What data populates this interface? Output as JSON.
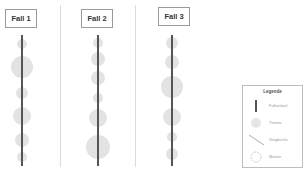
{
  "cases": [
    {
      "label": "Fall 1",
      "x": 22,
      "line_top": 35,
      "line_bottom": 166,
      "themes": [
        {
          "cy": 44,
          "r": 5
        },
        {
          "cy": 67,
          "r": 11
        },
        {
          "cy": 93,
          "r": 6
        },
        {
          "cy": 116,
          "r": 9
        },
        {
          "cy": 140,
          "r": 7
        },
        {
          "cy": 157,
          "r": 5
        }
      ]
    },
    {
      "label": "Fall 2",
      "x": 98,
      "line_top": 35,
      "line_bottom": 166,
      "themes": [
        {
          "cy": 43,
          "r": 5
        },
        {
          "cy": 59,
          "r": 7
        },
        {
          "cy": 78,
          "r": 7
        },
        {
          "cy": 98,
          "r": 5
        },
        {
          "cy": 118,
          "r": 9
        },
        {
          "cy": 147,
          "r": 12
        }
      ]
    },
    {
      "label": "Fall 3",
      "x": 172,
      "line_top": 35,
      "line_bottom": 166,
      "themes": [
        {
          "cy": 43,
          "r": 6
        },
        {
          "cy": 62,
          "r": 7
        },
        {
          "cy": 87,
          "r": 11
        },
        {
          "cy": 117,
          "r": 9
        },
        {
          "cy": 137,
          "r": 5
        },
        {
          "cy": 154,
          "r": 6
        }
      ]
    }
  ],
  "dividers": [
    60,
    135
  ],
  "legend": {
    "title": "Legende",
    "items": [
      {
        "icon": "bar-icon",
        "label": "Fallverlauf"
      },
      {
        "icon": "circle-icon",
        "label": "Thema"
      },
      {
        "icon": "diagonal-line-icon",
        "label": "Vergleiche"
      },
      {
        "icon": "dashed-circle-icon",
        "label": "Muster"
      }
    ]
  },
  "colors": {
    "line": "#555555",
    "theme_fill": "#e3e3e3",
    "divider": "#dcdcdc",
    "border": "#9a9a9a"
  }
}
